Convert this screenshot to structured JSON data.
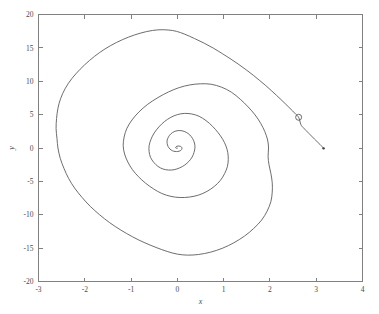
{
  "figure": {
    "background_color": "#ffffff",
    "axis_color": "#808080",
    "line_color": "#5c5c5c"
  },
  "chart_data": {
    "type": "line",
    "title": "",
    "subtitle": "",
    "xlabel": "x",
    "ylabel": "y",
    "xlim": [
      -3,
      4
    ],
    "ylim": [
      -20,
      20
    ],
    "xticks": [
      -3,
      -2,
      -1,
      0,
      1,
      2,
      3,
      4
    ],
    "yticks": [
      -20,
      -15,
      -10,
      -5,
      0,
      5,
      10,
      15,
      20
    ],
    "xtick_labels": [
      "-3",
      "-2",
      "-1",
      "0",
      "1",
      "2",
      "3",
      "4"
    ],
    "ytick_labels": [
      "-20",
      "-15",
      "-10",
      "-5",
      "0",
      "5",
      "10",
      "15",
      "20"
    ],
    "grid": false,
    "legend": null,
    "legend_position": "none",
    "box": true,
    "series": [
      {
        "name": "phase-trajectory",
        "style": "solid",
        "color": "#5c5c5c",
        "description": "inward spiral converging to origin, entering from the right",
        "points": [
          [
            3.16,
            -0.05
          ],
          [
            3.13,
            0.18
          ],
          [
            3.08,
            0.55
          ],
          [
            3.02,
            0.95
          ],
          [
            2.96,
            1.35
          ],
          [
            2.9,
            1.78
          ],
          [
            2.84,
            2.2
          ],
          [
            2.78,
            2.62
          ],
          [
            2.72,
            3.05
          ],
          [
            2.67,
            3.5
          ],
          [
            2.62,
            4.6
          ],
          [
            2.56,
            5.05
          ],
          [
            2.49,
            5.55
          ],
          [
            2.41,
            6.1
          ],
          [
            2.33,
            6.65
          ],
          [
            2.24,
            7.25
          ],
          [
            2.14,
            7.9
          ],
          [
            2.03,
            8.6
          ],
          [
            1.91,
            9.35
          ],
          [
            1.78,
            10.1
          ],
          [
            1.64,
            10.9
          ],
          [
            1.49,
            11.7
          ],
          [
            1.33,
            12.5
          ],
          [
            1.16,
            13.3
          ],
          [
            0.98,
            14.1
          ],
          [
            0.78,
            14.95
          ],
          [
            0.58,
            15.7
          ],
          [
            0.37,
            16.4
          ],
          [
            0.16,
            17.05
          ],
          [
            -0.02,
            17.48
          ],
          [
            -0.2,
            17.68
          ],
          [
            -0.42,
            17.7
          ],
          [
            -0.66,
            17.45
          ],
          [
            -0.92,
            16.95
          ],
          [
            -1.18,
            16.25
          ],
          [
            -1.44,
            15.35
          ],
          [
            -1.68,
            14.3
          ],
          [
            -1.9,
            13.1
          ],
          [
            -2.1,
            11.8
          ],
          [
            -2.28,
            10.4
          ],
          [
            -2.42,
            8.95
          ],
          [
            -2.52,
            7.45
          ],
          [
            -2.58,
            5.95
          ],
          [
            -2.61,
            4.4
          ],
          [
            -2.62,
            2.9
          ],
          [
            -2.6,
            1.4
          ],
          [
            -2.58,
            0.0
          ],
          [
            -2.53,
            -1.55
          ],
          [
            -2.45,
            -3.05
          ],
          [
            -2.35,
            -4.55
          ],
          [
            -2.22,
            -6.0
          ],
          [
            -2.06,
            -7.4
          ],
          [
            -1.88,
            -8.75
          ],
          [
            -1.68,
            -10.0
          ],
          [
            -1.46,
            -11.2
          ],
          [
            -1.22,
            -12.3
          ],
          [
            -0.97,
            -13.3
          ],
          [
            -0.72,
            -14.15
          ],
          [
            -0.46,
            -14.9
          ],
          [
            -0.22,
            -15.5
          ],
          [
            0.0,
            -15.9
          ],
          [
            0.22,
            -16.05
          ],
          [
            0.46,
            -15.95
          ],
          [
            0.72,
            -15.6
          ],
          [
            0.98,
            -15.0
          ],
          [
            1.22,
            -14.2
          ],
          [
            1.45,
            -13.2
          ],
          [
            1.65,
            -12.05
          ],
          [
            1.82,
            -10.8
          ],
          [
            1.94,
            -9.45
          ],
          [
            2.02,
            -8.05
          ],
          [
            2.05,
            -6.6
          ],
          [
            2.05,
            -5.2
          ],
          [
            2.02,
            -3.8
          ],
          [
            1.98,
            -2.5
          ],
          [
            1.96,
            -1.25
          ],
          [
            1.97,
            0.0
          ],
          [
            1.95,
            1.2
          ],
          [
            1.89,
            2.45
          ],
          [
            1.8,
            3.7
          ],
          [
            1.68,
            4.95
          ],
          [
            1.53,
            6.15
          ],
          [
            1.36,
            7.3
          ],
          [
            1.17,
            8.35
          ],
          [
            0.96,
            9.1
          ],
          [
            0.73,
            9.55
          ],
          [
            0.5,
            9.62
          ],
          [
            0.27,
            9.45
          ],
          [
            0.04,
            9.05
          ],
          [
            -0.19,
            8.4
          ],
          [
            -0.42,
            7.55
          ],
          [
            -0.64,
            6.55
          ],
          [
            -0.83,
            5.4
          ],
          [
            -0.98,
            4.2
          ],
          [
            -1.09,
            2.95
          ],
          [
            -1.15,
            1.65
          ],
          [
            -1.17,
            0.35
          ],
          [
            -1.14,
            -0.9
          ],
          [
            -1.07,
            -2.1
          ],
          [
            -0.97,
            -3.25
          ],
          [
            -0.84,
            -4.3
          ],
          [
            -0.69,
            -5.25
          ],
          [
            -0.52,
            -6.1
          ],
          [
            -0.34,
            -6.8
          ],
          [
            -0.14,
            -7.25
          ],
          [
            0.06,
            -7.42
          ],
          [
            0.26,
            -7.35
          ],
          [
            0.46,
            -7.05
          ],
          [
            0.64,
            -6.5
          ],
          [
            0.8,
            -5.75
          ],
          [
            0.93,
            -4.85
          ],
          [
            1.02,
            -3.85
          ],
          [
            1.08,
            -2.8
          ],
          [
            1.1,
            -1.75
          ],
          [
            1.09,
            -0.7
          ],
          [
            1.05,
            0.3
          ],
          [
            0.98,
            1.3
          ],
          [
            0.88,
            2.3
          ],
          [
            0.76,
            3.25
          ],
          [
            0.62,
            4.1
          ],
          [
            0.47,
            4.75
          ],
          [
            0.31,
            5.1
          ],
          [
            0.15,
            5.18
          ],
          [
            0.0,
            5.0
          ],
          [
            -0.14,
            4.6
          ],
          [
            -0.28,
            3.95
          ],
          [
            -0.4,
            3.15
          ],
          [
            -0.5,
            2.25
          ],
          [
            -0.57,
            1.3
          ],
          [
            -0.61,
            0.35
          ],
          [
            -0.61,
            -0.55
          ],
          [
            -0.58,
            -1.4
          ],
          [
            -0.51,
            -2.15
          ],
          [
            -0.42,
            -2.75
          ],
          [
            -0.31,
            -3.15
          ],
          [
            -0.19,
            -3.3
          ],
          [
            -0.07,
            -3.25
          ],
          [
            0.05,
            -2.98
          ],
          [
            0.16,
            -2.55
          ],
          [
            0.25,
            -2.0
          ],
          [
            0.32,
            -1.35
          ],
          [
            0.36,
            -0.65
          ],
          [
            0.38,
            0.05
          ],
          [
            0.37,
            0.75
          ],
          [
            0.33,
            1.4
          ],
          [
            0.27,
            1.95
          ],
          [
            0.19,
            2.35
          ],
          [
            0.1,
            2.58
          ],
          [
            0.01,
            2.6
          ],
          [
            -0.07,
            2.45
          ],
          [
            -0.14,
            2.12
          ],
          [
            -0.19,
            1.68
          ],
          [
            -0.22,
            1.18
          ],
          [
            -0.22,
            0.68
          ],
          [
            -0.2,
            0.22
          ],
          [
            -0.16,
            -0.15
          ],
          [
            -0.11,
            -0.4
          ],
          [
            -0.05,
            -0.52
          ],
          [
            0.01,
            -0.52
          ],
          [
            0.06,
            -0.42
          ],
          [
            0.09,
            -0.24
          ],
          [
            0.1,
            -0.04
          ],
          [
            0.09,
            0.14
          ],
          [
            0.06,
            0.26
          ],
          [
            0.02,
            0.3
          ],
          [
            -0.01,
            0.26
          ],
          [
            -0.03,
            0.18
          ],
          [
            -0.04,
            0.08
          ],
          [
            -0.03,
            0.0
          ],
          [
            -0.01,
            -0.04
          ],
          [
            0.0,
            -0.03
          ]
        ]
      }
    ],
    "markers": [
      {
        "name": "initial-condition-marker",
        "shape": "circle-open",
        "x": 2.62,
        "y": 4.6,
        "size": 3
      },
      {
        "name": "trajectory-endpoint",
        "shape": "dot",
        "x": 3.16,
        "y": -0.05,
        "size": 1.2
      }
    ]
  }
}
